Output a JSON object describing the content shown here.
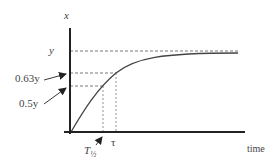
{
  "diagram": {
    "title": "",
    "y_axis_label": "x",
    "x_axis_label": "time",
    "levels": [
      {
        "name": "final-value",
        "label": "y",
        "fraction": 1.0
      },
      {
        "name": "63-percent",
        "label": "0.63y",
        "fraction": 0.63
      },
      {
        "name": "50-percent",
        "label": "0.5y",
        "fraction": 0.5
      }
    ],
    "time_markers": [
      {
        "name": "half-life",
        "label_main": "T",
        "label_sub": "½"
      },
      {
        "name": "time-constant",
        "label": "τ"
      }
    ],
    "curve": "first-order exponential rise x = y(1 - e^(-t/τ))"
  }
}
